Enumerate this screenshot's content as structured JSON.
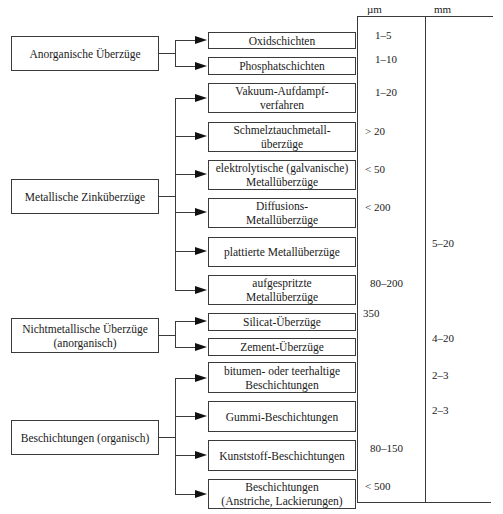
{
  "table_header": {
    "unit_um": "µm",
    "unit_mm": "mm"
  },
  "categories": [
    {
      "label": "Anorganische Überzüge",
      "children": [
        {
          "label": "Oxidschichten",
          "um": "1–5",
          "mm": ""
        },
        {
          "label": "Phosphatschichten",
          "um": "1–10",
          "mm": ""
        }
      ]
    },
    {
      "label": "Metallische Zinküberzüge",
      "children": [
        {
          "label": "Vakuum-Aufdampf-\nverfahren",
          "um": "1–20",
          "mm": ""
        },
        {
          "label": "Schmelztauchmetall-\nüberzüge",
          "um": "> 20",
          "mm": ""
        },
        {
          "label": "elektrolytische (galvanische)\nMetallüberzüge",
          "um": "< 50",
          "mm": ""
        },
        {
          "label": "Diffusions-\nMetallüberzüge",
          "um": "< 200",
          "mm": ""
        },
        {
          "label": "plattierte Metallüberzüge",
          "um": "",
          "mm": "5–20"
        },
        {
          "label": "aufgespritzte\nMetallüberzüge",
          "um": "80–200",
          "mm": ""
        }
      ]
    },
    {
      "label": "Nichtmetallische Überzüge\n(anorganisch)",
      "children": [
        {
          "label": "Silicat-Überzüge",
          "um": "350",
          "mm": ""
        },
        {
          "label": "Zement-Überzüge",
          "um": "",
          "mm": "4–20"
        }
      ]
    },
    {
      "label": "Beschichtungen (organisch)",
      "children": [
        {
          "label": "bitumen- oder teerhaltige\nBeschichtungen",
          "um": "",
          "mm": "2–3"
        },
        {
          "label": "Gummi-Beschichtungen",
          "um": "",
          "mm": "2–3"
        },
        {
          "label": "Kunststoff-Beschichtungen",
          "um": "80–150",
          "mm": ""
        },
        {
          "label": "Beschichtungen\n(Anstriche, Lackierungen)",
          "um": "< 500",
          "mm": ""
        }
      ]
    }
  ]
}
